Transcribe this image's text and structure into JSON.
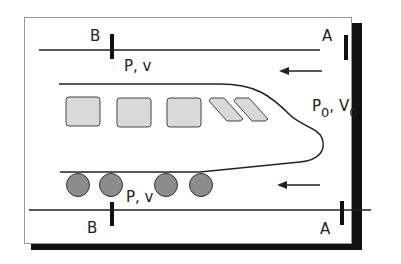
{
  "labels": {
    "top_B": "B",
    "top_A": "A",
    "bottom_B": "B",
    "bottom_A": "A",
    "top_pv": "P, v",
    "bottom_pv": "P, v",
    "free_stream_P": "P",
    "free_stream_P_sub": "0",
    "free_stream_sep": ", ",
    "free_stream_V": "V",
    "free_stream_V_sub": "0"
  },
  "colors": {
    "frame_border": "#999999",
    "shadow": "#111111",
    "line": "#222222",
    "window_fill": "#d9d9d9",
    "wheel_fill": "#8c8c8c"
  },
  "train": {
    "windows": 3,
    "slanted_windows": 2,
    "wheels": 5
  }
}
